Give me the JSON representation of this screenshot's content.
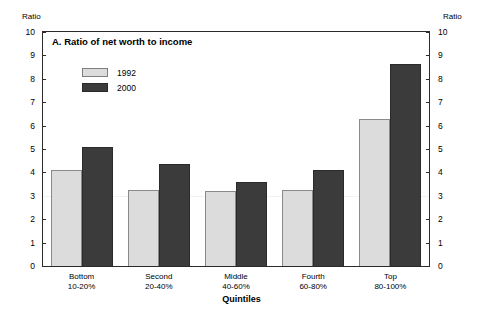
{
  "chart_data": {
    "type": "bar",
    "title": "A. Ratio of net worth to income",
    "xlabel": "Quintiles",
    "ylabel": "Ratio",
    "ylabel_right": "Ratio",
    "ylim": [
      0,
      10
    ],
    "yticks": [
      0,
      1,
      2,
      3,
      4,
      5,
      6,
      7,
      8,
      9,
      10
    ],
    "ytick_labels": [
      "0",
      "1",
      "2",
      "3",
      "4",
      "5",
      "6",
      "7",
      "8",
      "9",
      "10"
    ],
    "grid": false,
    "legend_position": "upper-left-inside",
    "categories": [
      "Bottom 10-20%",
      "Second 20-40%",
      "Middle 40-60%",
      "Fourth 60-80%",
      "Top 80-100%"
    ],
    "category_lines": [
      [
        "Bottom",
        "10-20%"
      ],
      [
        "Second",
        "20-40%"
      ],
      [
        "Middle",
        "40-60%"
      ],
      [
        "Fourth",
        "60-80%"
      ],
      [
        "Top",
        "80-100%"
      ]
    ],
    "series": [
      {
        "name": "1992",
        "color": "#dcdcdc",
        "values": [
          4.1,
          3.25,
          3.2,
          3.25,
          6.3
        ]
      },
      {
        "name": "2000",
        "color": "#3b3b3b",
        "values": [
          5.1,
          4.35,
          3.6,
          4.1,
          8.65
        ]
      }
    ]
  },
  "colors": {
    "series_1992": "#dcdcdc",
    "series_2000": "#3b3b3b",
    "frame": "#2b2b2b",
    "background": "#ffffff"
  }
}
